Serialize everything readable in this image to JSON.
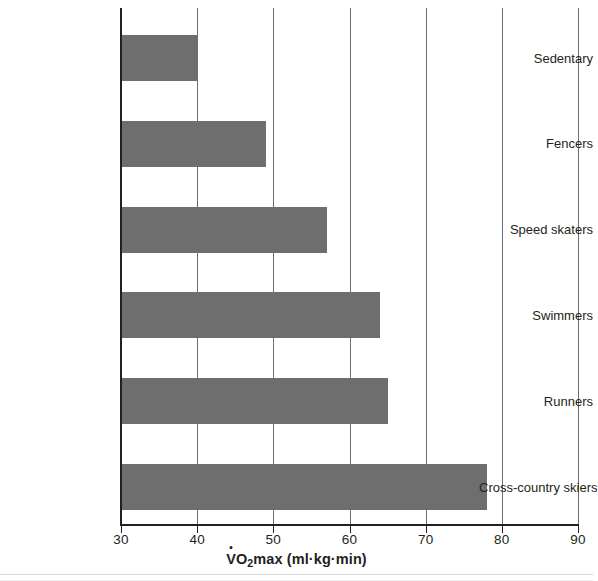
{
  "chart_data": {
    "type": "bar",
    "orientation": "horizontal",
    "title": "",
    "xlabel": "V̇O2max (ml·kg·min)",
    "xlabel_parts": {
      "v": "V",
      "o": "O",
      "sub": "2",
      "rest": "max (ml·kg·min)"
    },
    "ylabel": "",
    "categories": [
      "Sedentary",
      "Fencers",
      "Speed skaters",
      "Swimmers",
      "Runners",
      "Cross-country skiers"
    ],
    "values": [
      40,
      49,
      57,
      64,
      65,
      78
    ],
    "xlim": [
      30,
      90
    ],
    "xticks": [
      30,
      40,
      50,
      60,
      70,
      80,
      90
    ],
    "xtick_labels": [
      "30",
      "40",
      "50",
      "60",
      "70",
      "80",
      "90"
    ],
    "grid": "vertical",
    "legend": "none",
    "bar_color": "#6e6e6e",
    "axis_color": "#231f20",
    "gridline_color": "#6d6e71",
    "background_color": "#ffffff"
  }
}
